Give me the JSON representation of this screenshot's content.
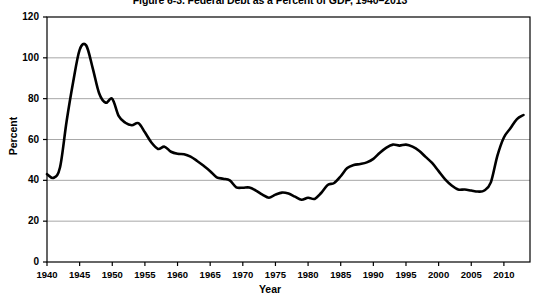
{
  "chart_data": {
    "type": "line",
    "title": "Figure 6-3. Federal Debt as a Percent of GDP, 1940–2013",
    "xlabel": "Year",
    "ylabel": "Percent",
    "ylim": [
      0,
      120
    ],
    "xlim": [
      1940,
      2014
    ],
    "ytick_step": 20,
    "xtick_step": 5,
    "grid": "horizontal",
    "legend": "none",
    "yticks": [
      0,
      20,
      40,
      60,
      80,
      100,
      120
    ],
    "xticks": [
      1940,
      1945,
      1950,
      1955,
      1960,
      1965,
      1970,
      1975,
      1980,
      1985,
      1990,
      1995,
      2000,
      2005,
      2010
    ],
    "series": [
      {
        "name": "Federal Debt as a Percent of GDP",
        "color": "#000000",
        "x": [
          1940,
          1941,
          1942,
          1943,
          1944,
          1945,
          1946,
          1947,
          1948,
          1949,
          1950,
          1951,
          1952,
          1953,
          1954,
          1955,
          1956,
          1957,
          1958,
          1959,
          1960,
          1961,
          1962,
          1963,
          1964,
          1965,
          1966,
          1967,
          1968,
          1969,
          1970,
          1971,
          1972,
          1973,
          1974,
          1975,
          1976,
          1977,
          1978,
          1979,
          1980,
          1981,
          1982,
          1983,
          1984,
          1985,
          1986,
          1987,
          1988,
          1989,
          1990,
          1991,
          1992,
          1993,
          1994,
          1995,
          1996,
          1997,
          1998,
          1999,
          2000,
          2001,
          2002,
          2003,
          2004,
          2005,
          2006,
          2007,
          2008,
          2009,
          2010,
          2011,
          2012,
          2013
        ],
        "values": [
          43.0,
          41.2,
          46.4,
          68.8,
          88.0,
          103.9,
          106.1,
          95.0,
          82.5,
          78.0,
          79.9,
          71.4,
          68.2,
          67.0,
          68.0,
          63.5,
          58.5,
          55.4,
          56.5,
          54.0,
          53.0,
          52.8,
          51.6,
          49.5,
          47.1,
          44.5,
          41.5,
          40.8,
          40.0,
          36.6,
          36.4,
          36.5,
          35.0,
          33.0,
          31.5,
          33.0,
          34.0,
          33.5,
          32.0,
          30.5,
          31.5,
          30.9,
          33.8,
          37.7,
          38.7,
          42.0,
          46.0,
          47.5,
          48.0,
          48.8,
          50.5,
          53.5,
          56.0,
          57.5,
          57.0,
          57.5,
          56.5,
          54.5,
          51.5,
          48.5,
          44.5,
          40.5,
          37.5,
          35.5,
          35.5,
          35.0,
          34.5,
          35.0,
          39.0,
          52.0,
          61.0,
          65.5,
          70.0,
          72.0
        ]
      }
    ],
    "annotations": []
  }
}
